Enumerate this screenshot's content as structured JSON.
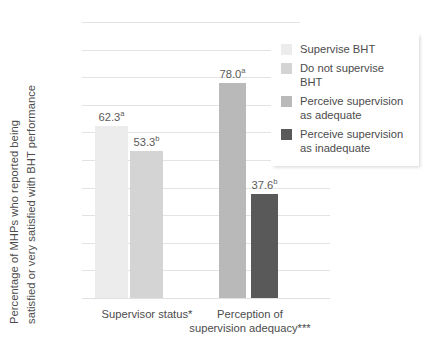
{
  "chart_data": {
    "type": "bar",
    "title": "",
    "xlabel": "",
    "ylabel_line1": "Percentage of MHPs who reported being",
    "ylabel_line2": "satisfied or very satisfied with BHT performance",
    "ylim": [
      0,
      100
    ],
    "yticks": [
      100,
      90,
      80,
      70,
      60,
      50,
      40,
      30,
      20,
      10,
      0
    ],
    "grid": true,
    "legend_position": "top-right",
    "groups": [
      {
        "label_line1": "Supervisor status*",
        "label_line2": ""
      },
      {
        "label_line1": "Perception of",
        "label_line2": "supervision adequacy***"
      }
    ],
    "categories": [
      "Supervise BHT",
      "Do not supervise BHT",
      "Perceive supervision as adequate",
      "Perceive supervision as inadequate"
    ],
    "values": [
      62.3,
      53.3,
      78.0,
      37.6
    ],
    "value_labels": [
      "62.3",
      "53.3",
      "78.0",
      "37.6"
    ],
    "value_superscripts": [
      "a",
      "b",
      "a",
      "b"
    ],
    "bar_colors": [
      "#ececec",
      "#d4d4d4",
      "#b9b9b9",
      "#595959"
    ]
  },
  "legend": {
    "items": [
      {
        "label_line1": "Supervise BHT",
        "label_line2": "",
        "color": "#ececec"
      },
      {
        "label_line1": "Do not supervise BHT",
        "label_line2": "",
        "color": "#d4d4d4"
      },
      {
        "label_line1": "Perceive supervision",
        "label_line2": "as adequate",
        "color": "#b9b9b9"
      },
      {
        "label_line1": "Perceive supervision",
        "label_line2": "as inadequate",
        "color": "#595959"
      }
    ]
  }
}
